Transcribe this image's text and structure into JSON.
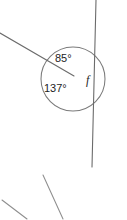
{
  "figure": {
    "background_color": "#ffffff",
    "line_color": "#6b6b6b",
    "circle_color": "#7a7a7a",
    "text_color": "#1d1d1d",
    "vertex": {
      "x": 74,
      "y": 76
    },
    "circle": {
      "cx": 73,
      "cy": 79,
      "r": 32
    },
    "labels": {
      "angle_upper": "85°",
      "angle_lower": "137°",
      "angle_unknown": "f"
    },
    "label_positions": {
      "angle_upper": {
        "x": 55,
        "y": 62
      },
      "angle_lower": {
        "x": 44,
        "y": 92
      },
      "angle_unknown": {
        "x": 86,
        "y": 84
      }
    },
    "lines": [
      {
        "name": "ray-upper-left",
        "x1": 0,
        "y1": 33,
        "x2": 74,
        "y2": 76
      },
      {
        "name": "transversal-line",
        "x1": 96,
        "y1": 0,
        "x2": 92,
        "y2": 167
      },
      {
        "name": "fragment-lower-middle",
        "x1": 43,
        "y1": 175,
        "x2": 63,
        "y2": 219
      },
      {
        "name": "fragment-lower-left",
        "x1": 2,
        "y1": 200,
        "x2": 27,
        "y2": 219
      },
      {
        "name": "fragment-lower-right",
        "x1": 91,
        "y1": 158,
        "x2": 94,
        "y2": 176
      }
    ]
  }
}
